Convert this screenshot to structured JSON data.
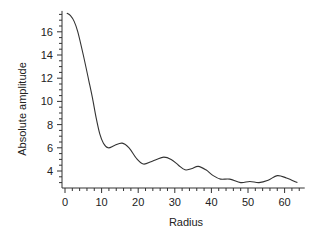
{
  "chart_data": {
    "type": "line",
    "title": "",
    "xlabel": "Radius",
    "ylabel": "Absolute amplitude",
    "xlim": [
      0,
      65.5
    ],
    "ylim": [
      2.5,
      17.8
    ],
    "grid": false,
    "legend": null,
    "x_ticks": [
      0,
      10,
      20,
      30,
      40,
      50,
      60
    ],
    "y_ticks": [
      4,
      6,
      8,
      10,
      12,
      14,
      16
    ],
    "series": [
      {
        "name": "amplitude",
        "color": "#333333",
        "x": [
          0.5,
          1.5,
          2.5,
          3.5,
          5,
          6.5,
          7.5,
          8.5,
          9.5,
          10.5,
          11.8,
          13.5,
          15.6,
          17.5,
          19.5,
          21.4,
          23.5,
          25,
          27,
          29,
          31,
          32.8,
          34.5,
          36.4,
          38.5,
          40.5,
          42.5,
          45,
          48,
          50.5,
          53,
          55.5,
          58,
          60.5,
          63.5
        ],
        "y": [
          17.6,
          17.4,
          16.9,
          16.0,
          14.0,
          11.8,
          10.3,
          8.6,
          7.2,
          6.4,
          6.0,
          6.2,
          6.4,
          6.0,
          5.1,
          4.6,
          4.8,
          5.0,
          5.2,
          5.0,
          4.5,
          4.1,
          4.2,
          4.4,
          4.1,
          3.6,
          3.3,
          3.3,
          3.0,
          3.1,
          3.0,
          3.2,
          3.6,
          3.4,
          3.0
        ]
      }
    ]
  }
}
